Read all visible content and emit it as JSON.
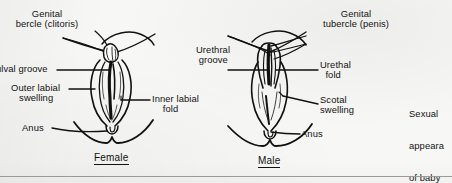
{
  "figure": {
    "title_visible": false,
    "background_color": "#f7f7f5",
    "ink_color": "#111111"
  },
  "panels": [
    {
      "id": "female",
      "caption": "Female",
      "labels": [
        {
          "id": "genital-tubercle-clitoris",
          "text": "Genital\nbercle (clitoris)",
          "truncated_left": true,
          "full_text": "Genital tubercle (clitoris)"
        },
        {
          "id": "vulval-groove",
          "text": "ulval groove",
          "truncated_left": true,
          "full_text": "Vulval groove"
        },
        {
          "id": "outer-labial-swelling",
          "text": "Outer labial\n   swelling"
        },
        {
          "id": "inner-labial-fold",
          "text": "Inner labial\n    fold"
        },
        {
          "id": "anus-female",
          "text": "Anus"
        }
      ]
    },
    {
      "id": "male",
      "caption": "Male",
      "labels": [
        {
          "id": "genital-tubercle-penis",
          "text": "Genital\ntubercle (penis)"
        },
        {
          "id": "urethral-groove",
          "text": "Urethral\n groove"
        },
        {
          "id": "urethal-fold",
          "text": "Urethal\n  fold"
        },
        {
          "id": "scotal-swelling",
          "text": "Scotal\nswelling"
        },
        {
          "id": "anus-male",
          "text": "Anus"
        }
      ]
    }
  ],
  "side_note": {
    "id": "sexual-appearance-note",
    "lines": [
      "Sexual",
      "appeara",
      "of baby",
      "3rd to ",
      "month",
      "pregna"
    ],
    "truncated_right": true,
    "full_text_estimate": "Sexual appearance of baby 3rd to 4th month of pregnancy"
  }
}
